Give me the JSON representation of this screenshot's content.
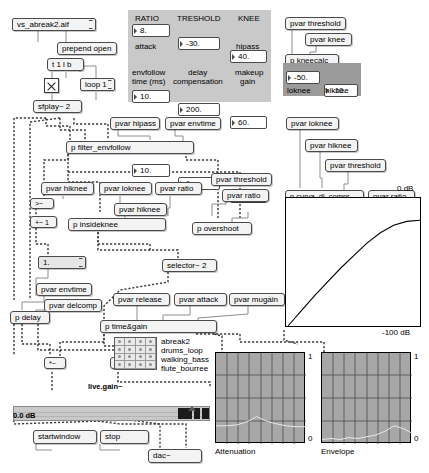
{
  "patch": {
    "title": "pd compressor patch",
    "file_message": "vs_abreak2.aif",
    "prepend": "prepend open",
    "trigger": "t 1 l b",
    "loop": "loop 1",
    "sfplay": "sfplay~ 2"
  },
  "params_panel": {
    "fields": [
      {
        "label": "RATIO",
        "value": "8."
      },
      {
        "label": "TRESHOLD",
        "value": "-30."
      },
      {
        "label": "KNEE",
        "value": "40."
      },
      {
        "label": "attack",
        "value": "10."
      },
      {
        "label": "release",
        "value": "200."
      },
      {
        "label": "hipass",
        "value": "60."
      },
      {
        "label": "envfollow\ntime (ms)",
        "value": "10."
      },
      {
        "label": "delay\ncompensation",
        "value": "1."
      },
      {
        "label": "makeup\ngain",
        "value": "19."
      }
    ],
    "labels": {
      "ratio": "RATIO",
      "threshold": "TRESHOLD",
      "knee": "KNEE",
      "attack": "attack",
      "release": "release",
      "hipass": "hipass",
      "envfollow_l1": "envfollow",
      "envfollow_l2": "time (ms)",
      "delay_l1": "delay",
      "delay_l2": "compensation",
      "makeup_l1": "makeup",
      "makeup_l2": "gain"
    },
    "values": {
      "ratio": "8.",
      "threshold": "-30.",
      "knee": "40.",
      "attack": "10.",
      "release": "200.",
      "hipass": "60.",
      "envfollow": "10.",
      "delay": "1.",
      "makeup": "19."
    }
  },
  "kneecalc": {
    "pvar_threshold": "pvar threshold",
    "pvar_knee": "pvar knee",
    "object": "p kneecalc",
    "loknee_value": "-50.",
    "hiknee_value": "-10.",
    "loknee_label": "loknee",
    "hiknee_label": "hiknee"
  },
  "objects": {
    "pvar_hipass": "pvar hipass",
    "pvar_envtime_top": "pvar envtime",
    "filter_envfollow": "p filter_envfollow",
    "pvar_hiknee_a": "pvar hiknee",
    "pvar_loknee": "pvar loknee",
    "pvar_ratio_a": "pvar ratio",
    "pvar_hiknee_b": "pvar hiknee",
    "insideknee": "p insideknee",
    "gt_tilde": ">~",
    "plus_tilde": "+~ 1",
    "one_message": "1.",
    "pvar_envtime_b": "pvar envtime",
    "pvar_delcomp": "pvar delcomp",
    "p_delay": "p delay",
    "selector": "selector~ 2",
    "pvar_threshold_b": "pvar threshold",
    "pvar_ratio_b": "pvar ratio",
    "p_overshoot": "p overshoot",
    "pvar_loknee_c": "pvar loknee",
    "pvar_hiknee_c": "pvar hiknee",
    "pvar_threshold_c": "pvar threshold",
    "curva": "p curva_di_compr",
    "pvar_ratio_c": "pvar ratio",
    "pvar_release": "pvar release",
    "pvar_attack": "pvar attack",
    "pvar_mugain": "pvar mugain",
    "time_gain": "p time&gain",
    "mult_a": "*~",
    "mult_b": "*~",
    "startwindow": "startwindow",
    "stop": "stop",
    "dac": "dac~"
  },
  "sound_list": {
    "items": [
      "abreak2",
      "drums_loop",
      "walking_bass",
      "flute_bourree"
    ]
  },
  "gain_slider": {
    "title": "live.gain~",
    "readout": "0.0 dB"
  },
  "chart_data": [
    {
      "type": "line",
      "name": "compression-curve",
      "title": "",
      "xlabel": "input level (dB)",
      "ylabel": "output level (dB)",
      "xlim": [
        -100,
        0
      ],
      "ylim": [
        -100,
        0
      ],
      "axis_labels": {
        "top_right": "0 dB",
        "bottom_right": "-100 dB"
      },
      "grid": false,
      "x": [
        -100,
        -90,
        -80,
        -70,
        -60,
        -50,
        -40,
        -30,
        -20,
        -10,
        0
      ],
      "y": [
        -100,
        -88,
        -76,
        -65,
        -54,
        -44,
        -34,
        -26,
        -20,
        -17,
        -16
      ]
    },
    {
      "type": "line",
      "name": "attenuation-scope",
      "title": "Attenuation",
      "ylim": [
        0,
        1
      ],
      "grid": true,
      "ytick_top": "1",
      "ytick_bottom": "0",
      "x": [
        0,
        0.12,
        0.23,
        0.3,
        0.38,
        0.45,
        0.52,
        0.6,
        0.68,
        0.78,
        0.88,
        1
      ],
      "y": [
        0.2,
        0.2,
        0.21,
        0.23,
        0.26,
        0.3,
        0.27,
        0.24,
        0.22,
        0.2,
        0.19,
        0.19
      ]
    },
    {
      "type": "line",
      "name": "envelope-scope",
      "title": "Envelope",
      "ylim": [
        0,
        1
      ],
      "grid": true,
      "ytick_top": "1",
      "ytick_bottom": "0",
      "x": [
        0,
        0.1,
        0.2,
        0.3,
        0.4,
        0.5,
        0.6,
        0.7,
        0.8,
        0.9,
        1
      ],
      "y": [
        0.05,
        0.06,
        0.05,
        0.07,
        0.06,
        0.08,
        0.1,
        0.14,
        0.2,
        0.17,
        0.12
      ]
    }
  ],
  "scopes": {
    "attenuation_label": "Attenuation",
    "envelope_label": "Envelope",
    "top_tick": "1",
    "bottom_tick": "0"
  },
  "curve_graph": {
    "top_label": "0 dB",
    "bottom_label": "-100 dB"
  }
}
